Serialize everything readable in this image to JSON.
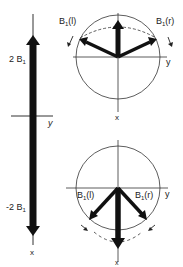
{
  "diagram": {
    "linear_field": {
      "upper_label": "2 B",
      "upper_sub": "1",
      "lower_label": "-2 B",
      "lower_sub": "1",
      "axis_y_label": "y",
      "axis_x_label": "x"
    },
    "top_circle": {
      "left_component_label": "B",
      "left_component_sub": "1",
      "left_component_suffix": "(l)",
      "right_component_label": "B",
      "right_component_sub": "1",
      "right_component_suffix": "(r)",
      "axis_y_label": "y",
      "axis_x_label": "x"
    },
    "bottom_circle": {
      "left_component_label": "B",
      "left_component_sub": "1",
      "left_component_suffix": "(l)",
      "right_component_label": "B",
      "right_component_sub": "1",
      "right_component_suffix": "(r)",
      "axis_y_label": "y",
      "axis_x_label": "x"
    },
    "colors": {
      "ink": "#111111",
      "line": "#333333",
      "background": "#ffffff"
    }
  }
}
